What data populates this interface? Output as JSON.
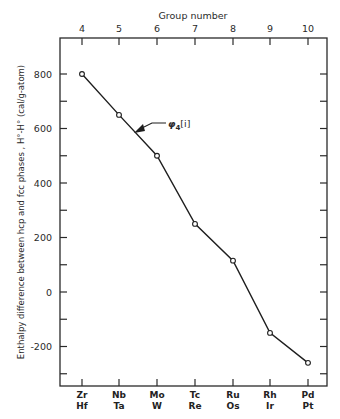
{
  "chart_data": {
    "type": "line",
    "title": "",
    "top_axis_title": "Group number",
    "top_axis_ticks": [
      "4",
      "5",
      "6",
      "7",
      "8",
      "9",
      "10"
    ],
    "xlabel": "",
    "ylabel": "Enthalpy difference between hcp and fcc phases , H°-H° (cal/g-atom)",
    "categories_top": [
      "Zr",
      "Nb",
      "Mo",
      "Tc",
      "Ru",
      "Rh",
      "Pd"
    ],
    "categories_bottom": [
      "Hf",
      "Ta",
      "W",
      "Re",
      "Os",
      "Ir",
      "Pt"
    ],
    "series": [
      {
        "name": "φ₄[i]",
        "values": [
          800,
          650,
          500,
          250,
          115,
          -150,
          -260
        ],
        "marker": "open-circle"
      }
    ],
    "annotation": {
      "text_main": "φ",
      "text_sub": "4",
      "text_tail": "[i]"
    },
    "yticks": [
      -200,
      0,
      200,
      400,
      600,
      800
    ],
    "ylim": [
      -330,
      950
    ],
    "grid": false,
    "legend": "none (inline arrow annotation)"
  }
}
